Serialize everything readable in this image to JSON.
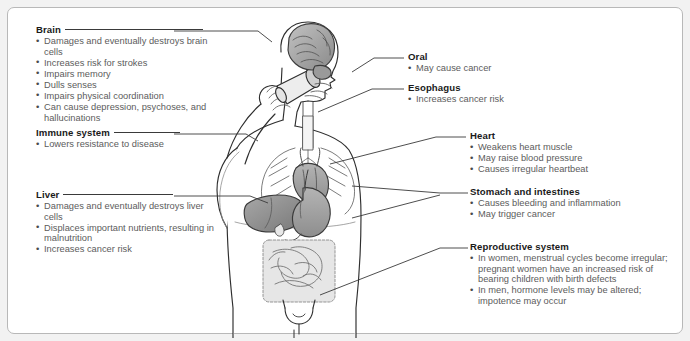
{
  "figure": {
    "panel_bg": "#ffffff",
    "page_bg": "#f2f2f2",
    "border_color": "#b8b8b8",
    "heading_color": "#1a1a1a",
    "body_color": "#5c5c5c",
    "leader_color": "#3a3a3a"
  },
  "labels": {
    "brain": {
      "heading": "Brain",
      "items": [
        "Damages and eventually destroys brain cells",
        "Increases risk for strokes",
        "Impairs memory",
        "Dulls senses",
        "Impairs physical coordination",
        "Can cause depression, psychoses, and hallucinations"
      ]
    },
    "immune_system": {
      "heading": "Immune system",
      "items": [
        "Lowers resistance to disease"
      ]
    },
    "liver": {
      "heading": "Liver",
      "items": [
        "Damages and eventually destroys liver cells",
        "Displaces important nutrients, resulting in malnutrition",
        "Increases cancer risk"
      ]
    },
    "oral": {
      "heading": "Oral",
      "items": [
        "May cause cancer"
      ]
    },
    "esophagus": {
      "heading": "Esophagus",
      "items": [
        "Increases cancer risk"
      ]
    },
    "heart": {
      "heading": "Heart",
      "items": [
        "Weakens heart muscle",
        "May raise blood pressure",
        "Causes irregular heartbeat"
      ]
    },
    "stomach_and_intestines": {
      "heading": "Stomach and intestines",
      "items": [
        "Causes bleeding and inflammation",
        "May trigger cancer"
      ]
    },
    "reproductive_system": {
      "heading": "Reproductive system",
      "items": [
        "In women, menstrual cycles become irregular; pregnant women have an increased risk of bearing children with birth defects",
        "In men, hormone levels may be altered; impotence may occur"
      ]
    }
  },
  "artwork": {
    "subject": "human-figure-drinking-from-glass",
    "organs": [
      "brain",
      "mouth-and-throat",
      "esophagus",
      "heart",
      "lungs-and-blood-vessels",
      "liver",
      "stomach",
      "intestines",
      "reproductive-organs"
    ]
  }
}
